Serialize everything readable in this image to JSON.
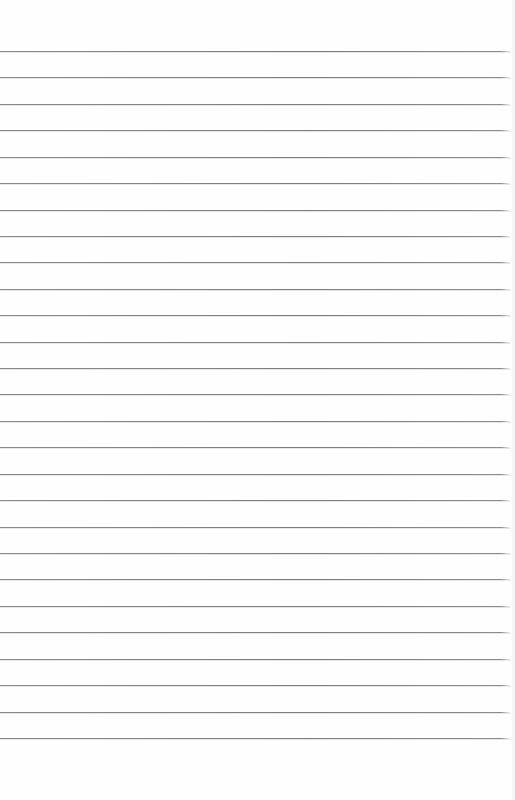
{
  "page": {
    "type": "lined-paper-sheet",
    "background_color": "#fefefe",
    "line_color": "#808080",
    "line_count": 27,
    "first_line_y": 51,
    "line_spacing": 26.42
  }
}
